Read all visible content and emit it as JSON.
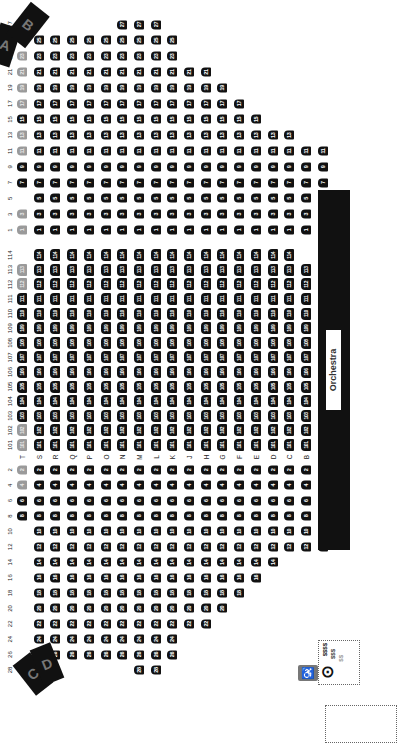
{
  "venue": {
    "stage_label": "Orchestra",
    "box_labels": [
      "A",
      "B",
      "C",
      "D"
    ]
  },
  "header": {
    "left_seats": [
      "28",
      "26",
      "24",
      "22",
      "20",
      "18",
      "16",
      "14",
      "12",
      "10",
      "8",
      "6",
      "4",
      "2"
    ],
    "center_seats": [
      "101",
      "102",
      "103",
      "104",
      "105",
      "106",
      "107",
      "108",
      "109",
      "110",
      "111",
      "112",
      "113",
      "114"
    ],
    "right_seats": [
      "1",
      "3",
      "5",
      "7",
      "9",
      "11",
      "13",
      "15",
      "17",
      "19",
      "21",
      "23",
      "25",
      "27"
    ]
  },
  "rows": [
    {
      "label": "T",
      "left": [
        "8",
        "6",
        "4",
        "2"
      ],
      "left_na": [
        "4",
        "2"
      ],
      "center": [
        "101",
        "102",
        "103",
        "104",
        "105",
        "106",
        "107",
        "108",
        "109",
        "110",
        "111",
        "112",
        "113"
      ],
      "center_na": [
        "101",
        "102",
        "112",
        "113"
      ],
      "right": [
        "1",
        "3",
        "7",
        "9",
        "11",
        "13",
        "15",
        "17",
        "19",
        "21",
        "23"
      ],
      "right_na": [
        "1",
        "3",
        "11",
        "13",
        "17",
        "19",
        "21",
        "23"
      ]
    },
    {
      "label": "S",
      "left": [
        "24",
        "22",
        "20",
        "18",
        "16",
        "14",
        "12",
        "10",
        "8",
        "6",
        "4",
        "2"
      ],
      "center": [
        "101",
        "102",
        "103",
        "104",
        "105",
        "106",
        "107",
        "108",
        "109",
        "110",
        "111",
        "112",
        "113",
        "114"
      ],
      "right": [
        "1",
        "3",
        "5",
        "7",
        "9",
        "11",
        "13",
        "15",
        "17",
        "19",
        "21",
        "23",
        "25"
      ]
    },
    {
      "label": "R",
      "left": [
        "26",
        "24",
        "22",
        "20",
        "18",
        "16",
        "14",
        "12",
        "10",
        "8",
        "6",
        "4",
        "2"
      ],
      "center": [
        "101",
        "102",
        "103",
        "104",
        "105",
        "106",
        "107",
        "108",
        "109",
        "110",
        "111",
        "112",
        "113",
        "114"
      ],
      "right": [
        "1",
        "3",
        "5",
        "7",
        "9",
        "11",
        "13",
        "15",
        "17",
        "19",
        "21",
        "23",
        "25"
      ]
    },
    {
      "label": "Q",
      "left": [
        "26",
        "24",
        "22",
        "20",
        "18",
        "16",
        "14",
        "12",
        "10",
        "8",
        "6",
        "4",
        "2"
      ],
      "center": [
        "101",
        "102",
        "103",
        "104",
        "105",
        "106",
        "107",
        "108",
        "109",
        "110",
        "111",
        "112",
        "113",
        "114"
      ],
      "right": [
        "1",
        "3",
        "5",
        "7",
        "9",
        "11",
        "13",
        "15",
        "17",
        "19",
        "21",
        "23",
        "25"
      ]
    },
    {
      "label": "P",
      "left": [
        "26",
        "24",
        "22",
        "20",
        "18",
        "16",
        "14",
        "12",
        "10",
        "8",
        "6",
        "4",
        "2"
      ],
      "center": [
        "101",
        "102",
        "103",
        "104",
        "105",
        "106",
        "107",
        "108",
        "109",
        "110",
        "111",
        "112",
        "113",
        "114"
      ],
      "right": [
        "1",
        "3",
        "5",
        "7",
        "9",
        "11",
        "13",
        "15",
        "17",
        "19",
        "21",
        "23",
        "25"
      ]
    },
    {
      "label": "O",
      "left": [
        "26",
        "24",
        "22",
        "20",
        "18",
        "16",
        "14",
        "12",
        "10",
        "8",
        "6",
        "4",
        "2"
      ],
      "center": [
        "101",
        "102",
        "103",
        "104",
        "105",
        "106",
        "107",
        "108",
        "109",
        "110",
        "111",
        "112",
        "113",
        "114"
      ],
      "right": [
        "1",
        "3",
        "5",
        "7",
        "9",
        "11",
        "13",
        "15",
        "17",
        "19",
        "21",
        "23",
        "25"
      ]
    },
    {
      "label": "N",
      "left": [
        "26",
        "24",
        "22",
        "20",
        "18",
        "16",
        "14",
        "12",
        "10",
        "8",
        "6",
        "4",
        "2"
      ],
      "center": [
        "101",
        "102",
        "103",
        "104",
        "105",
        "106",
        "107",
        "108",
        "109",
        "110",
        "111",
        "112",
        "113",
        "114"
      ],
      "right": [
        "1",
        "3",
        "5",
        "7",
        "9",
        "11",
        "13",
        "15",
        "17",
        "19",
        "21",
        "23",
        "25",
        "27"
      ]
    },
    {
      "label": "M",
      "left": [
        "28",
        "26",
        "24",
        "22",
        "20",
        "18",
        "16",
        "14",
        "12",
        "10",
        "8",
        "6",
        "4",
        "2"
      ],
      "center": [
        "101",
        "102",
        "103",
        "104",
        "105",
        "106",
        "107",
        "108",
        "109",
        "110",
        "111",
        "112",
        "113",
        "114"
      ],
      "right": [
        "1",
        "3",
        "5",
        "7",
        "9",
        "11",
        "13",
        "15",
        "17",
        "19",
        "21",
        "23",
        "25",
        "27"
      ]
    },
    {
      "label": "L",
      "left": [
        "28",
        "26",
        "24",
        "22",
        "20",
        "18",
        "16",
        "14",
        "12",
        "10",
        "8",
        "6",
        "4",
        "2"
      ],
      "center": [
        "101",
        "102",
        "103",
        "104",
        "105",
        "106",
        "107",
        "108",
        "109",
        "110",
        "111",
        "112",
        "113",
        "114"
      ],
      "right": [
        "1",
        "3",
        "5",
        "7",
        "9",
        "11",
        "13",
        "15",
        "17",
        "19",
        "21",
        "23",
        "25",
        "27"
      ]
    },
    {
      "label": "K",
      "left": [
        "26",
        "24",
        "22",
        "20",
        "18",
        "16",
        "14",
        "12",
        "10",
        "8",
        "6",
        "4",
        "2"
      ],
      "center": [
        "101",
        "102",
        "103",
        "104",
        "105",
        "106",
        "107",
        "108",
        "109",
        "110",
        "111",
        "112",
        "113",
        "114"
      ],
      "right": [
        "1",
        "3",
        "5",
        "7",
        "9",
        "11",
        "13",
        "15",
        "17",
        "19",
        "21",
        "23",
        "25"
      ]
    },
    {
      "label": "J",
      "left": [
        "22",
        "20",
        "18",
        "16",
        "14",
        "12",
        "10",
        "8",
        "6",
        "4",
        "2"
      ],
      "center": [
        "101",
        "102",
        "103",
        "104",
        "105",
        "106",
        "107",
        "108",
        "109",
        "110",
        "111",
        "112",
        "113",
        "114"
      ],
      "right": [
        "1",
        "3",
        "5",
        "7",
        "9",
        "11",
        "13",
        "15",
        "17",
        "19",
        "21"
      ]
    },
    {
      "label": "H",
      "left": [
        "22",
        "20",
        "18",
        "16",
        "14",
        "12",
        "10",
        "8",
        "6",
        "4",
        "2"
      ],
      "center": [
        "101",
        "102",
        "103",
        "104",
        "105",
        "106",
        "107",
        "108",
        "109",
        "110",
        "111",
        "112",
        "113",
        "114"
      ],
      "right": [
        "1",
        "3",
        "5",
        "7",
        "9",
        "11",
        "13",
        "15",
        "17",
        "19",
        "21"
      ]
    },
    {
      "label": "G",
      "left": [
        "20",
        "18",
        "16",
        "14",
        "12",
        "10",
        "8",
        "6",
        "4",
        "2"
      ],
      "center": [
        "101",
        "102",
        "103",
        "104",
        "105",
        "106",
        "107",
        "108",
        "109",
        "110",
        "111",
        "112",
        "113",
        "114"
      ],
      "right": [
        "1",
        "3",
        "5",
        "7",
        "9",
        "11",
        "13",
        "15",
        "17",
        "19"
      ]
    },
    {
      "label": "F",
      "left": [
        "18",
        "16",
        "14",
        "12",
        "10",
        "8",
        "6",
        "4",
        "2"
      ],
      "center": [
        "101",
        "102",
        "103",
        "104",
        "105",
        "106",
        "107",
        "108",
        "109",
        "110",
        "111",
        "112",
        "113",
        "114"
      ],
      "right": [
        "1",
        "3",
        "5",
        "7",
        "9",
        "11",
        "13",
        "15",
        "17"
      ]
    },
    {
      "label": "E",
      "left": [
        "16",
        "14",
        "12",
        "10",
        "8",
        "6",
        "4",
        "2"
      ],
      "center": [
        "101",
        "102",
        "103",
        "104",
        "105",
        "106",
        "107",
        "108",
        "109",
        "110",
        "111",
        "112",
        "113",
        "114"
      ],
      "right": [
        "1",
        "3",
        "5",
        "7",
        "9",
        "11",
        "13",
        "15"
      ]
    },
    {
      "label": "D",
      "left": [
        "14",
        "12",
        "10",
        "8",
        "6",
        "4",
        "2"
      ],
      "center": [
        "101",
        "102",
        "103",
        "104",
        "105",
        "106",
        "107",
        "108",
        "109",
        "110",
        "111",
        "112",
        "113",
        "114"
      ],
      "right": [
        "1",
        "3",
        "5",
        "7",
        "9",
        "11",
        "13"
      ]
    },
    {
      "label": "C",
      "left": [
        "12",
        "10",
        "8",
        "6",
        "4",
        "2"
      ],
      "center": [
        "101",
        "102",
        "103",
        "104",
        "105",
        "106",
        "107",
        "108",
        "109",
        "110",
        "111",
        "112",
        "113",
        "114"
      ],
      "right": [
        "1",
        "3",
        "5",
        "7",
        "9",
        "11",
        "13"
      ]
    },
    {
      "label": "B",
      "left": [
        "12",
        "10",
        "8",
        "6",
        "4",
        "2"
      ],
      "center": [
        "101",
        "102",
        "103",
        "104",
        "105",
        "106",
        "107",
        "108",
        "109",
        "110",
        "111",
        "112",
        "113"
      ],
      "right": [
        "1",
        "3",
        "5",
        "7",
        "9",
        "11"
      ]
    },
    {
      "label": "A",
      "left": [
        "12",
        "10",
        "8",
        "6",
        "4",
        "2"
      ],
      "center": [
        "101",
        "102",
        "103",
        "104",
        "105",
        "106",
        "107",
        "108",
        "109",
        "110",
        "111",
        "112",
        "113"
      ],
      "right": [
        "1",
        "3",
        "5",
        "7",
        "9",
        "11"
      ]
    }
  ],
  "legend": {
    "price_levels": [
      "$$$$",
      "$$$",
      "$$"
    ],
    "wheelchair_icon": "wheelchair-icon",
    "companion_icon": "companion-seat-icon"
  },
  "colors": {
    "available": "#111111",
    "unavailable": "#9a9a9a",
    "stage": "#111111"
  }
}
